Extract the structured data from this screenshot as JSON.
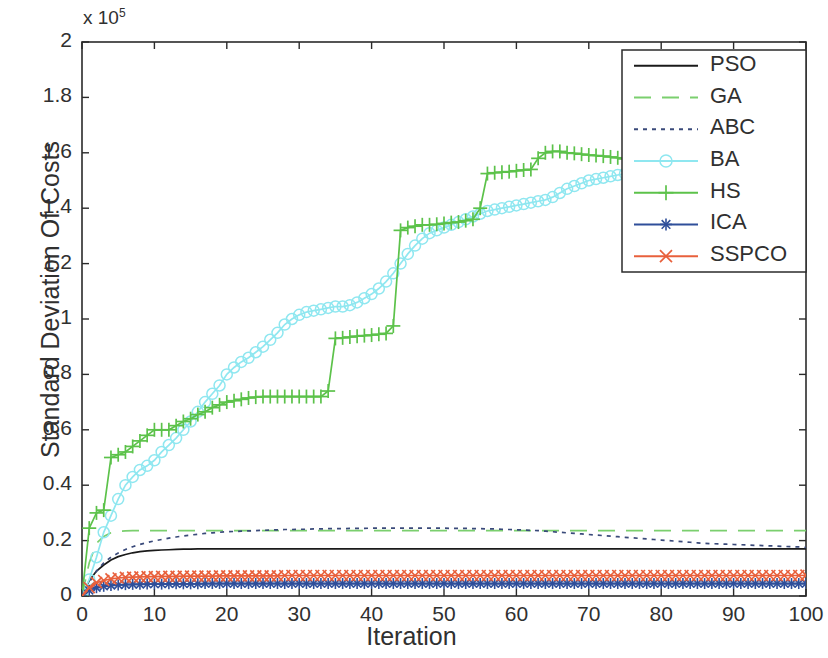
{
  "chart_data": {
    "type": "line",
    "title": "",
    "xlabel": "Iteration",
    "ylabel": "Standard Deviation Of Costs",
    "y_exponent_label": "x 10",
    "y_exponent_power": "5",
    "xlim": [
      0,
      100
    ],
    "ylim": [
      0,
      2
    ],
    "xticks": [
      0,
      10,
      20,
      30,
      40,
      50,
      60,
      70,
      80,
      90,
      100
    ],
    "xticklabels": [
      "0",
      "10",
      "20",
      "30",
      "40",
      "50",
      "60",
      "70",
      "80",
      "90",
      "100"
    ],
    "yticks": [
      0,
      0.2,
      0.4,
      0.6,
      0.8,
      1,
      1.2,
      1.4,
      1.6,
      1.8,
      2
    ],
    "yticklabels": [
      "0",
      "0.2",
      "0.4",
      "0.6",
      "0.8",
      "1",
      "1.2",
      "1.4",
      "1.6",
      "1.8",
      "2"
    ],
    "grid": false,
    "legend_position": "upper right",
    "x": [
      0,
      1,
      2,
      3,
      4,
      5,
      6,
      7,
      8,
      9,
      10,
      11,
      12,
      13,
      14,
      15,
      16,
      17,
      18,
      19,
      20,
      21,
      22,
      23,
      24,
      25,
      26,
      27,
      28,
      29,
      30,
      31,
      32,
      33,
      34,
      35,
      36,
      37,
      38,
      39,
      40,
      41,
      42,
      43,
      44,
      45,
      46,
      47,
      48,
      49,
      50,
      51,
      52,
      53,
      54,
      55,
      56,
      57,
      58,
      59,
      60,
      61,
      62,
      63,
      64,
      65,
      66,
      67,
      68,
      69,
      70,
      71,
      72,
      73,
      74,
      75,
      76,
      77,
      78,
      79,
      80,
      81,
      82,
      83,
      84,
      85,
      86,
      87,
      88,
      89,
      90,
      91,
      92,
      93,
      94,
      95,
      96,
      97,
      98,
      99,
      100
    ],
    "series": [
      {
        "name": "PSO",
        "color": "#1a1a1a",
        "style": "solid",
        "marker": "none",
        "values": [
          0,
          0.055,
          0.09,
          0.112,
          0.13,
          0.142,
          0.15,
          0.156,
          0.16,
          0.163,
          0.165,
          0.166,
          0.167,
          0.168,
          0.169,
          0.169,
          0.17,
          0.17,
          0.17,
          0.17,
          0.17,
          0.17,
          0.17,
          0.17,
          0.17,
          0.17,
          0.17,
          0.17,
          0.17,
          0.17,
          0.17,
          0.17,
          0.17,
          0.17,
          0.17,
          0.17,
          0.17,
          0.17,
          0.17,
          0.17,
          0.17,
          0.17,
          0.17,
          0.17,
          0.17,
          0.17,
          0.17,
          0.17,
          0.17,
          0.17,
          0.17,
          0.17,
          0.17,
          0.17,
          0.17,
          0.17,
          0.17,
          0.17,
          0.17,
          0.17,
          0.17,
          0.17,
          0.17,
          0.17,
          0.17,
          0.17,
          0.17,
          0.17,
          0.17,
          0.17,
          0.17,
          0.17,
          0.17,
          0.17,
          0.17,
          0.17,
          0.17,
          0.17,
          0.17,
          0.17,
          0.17,
          0.17,
          0.17,
          0.17,
          0.17,
          0.17,
          0.17,
          0.17,
          0.17,
          0.17,
          0.17,
          0.17,
          0.17,
          0.17,
          0.17,
          0.17,
          0.17,
          0.17,
          0.17,
          0.17,
          0.17
        ]
      },
      {
        "name": "GA",
        "color": "#7bcf6e",
        "style": "dashed",
        "marker": "none",
        "values": [
          0,
          0.12,
          0.19,
          0.215,
          0.228,
          0.233,
          0.235,
          0.236,
          0.236,
          0.236,
          0.236,
          0.236,
          0.236,
          0.236,
          0.236,
          0.236,
          0.236,
          0.236,
          0.236,
          0.236,
          0.236,
          0.236,
          0.236,
          0.236,
          0.236,
          0.236,
          0.236,
          0.236,
          0.236,
          0.236,
          0.236,
          0.236,
          0.236,
          0.236,
          0.236,
          0.236,
          0.236,
          0.236,
          0.236,
          0.236,
          0.236,
          0.236,
          0.236,
          0.236,
          0.236,
          0.236,
          0.236,
          0.236,
          0.236,
          0.236,
          0.236,
          0.236,
          0.236,
          0.236,
          0.236,
          0.236,
          0.236,
          0.236,
          0.236,
          0.236,
          0.236,
          0.236,
          0.236,
          0.236,
          0.236,
          0.236,
          0.236,
          0.236,
          0.236,
          0.236,
          0.236,
          0.236,
          0.236,
          0.236,
          0.236,
          0.236,
          0.236,
          0.236,
          0.236,
          0.236,
          0.236,
          0.236,
          0.236,
          0.236,
          0.236,
          0.236,
          0.236,
          0.236,
          0.236,
          0.236,
          0.236,
          0.236,
          0.236,
          0.236,
          0.236,
          0.236,
          0.236,
          0.236,
          0.236,
          0.236,
          0.236
        ]
      },
      {
        "name": "ABC",
        "color": "#3a4a7a",
        "style": "dotted",
        "marker": "none",
        "values": [
          0,
          0.05,
          0.09,
          0.12,
          0.14,
          0.155,
          0.168,
          0.178,
          0.186,
          0.193,
          0.199,
          0.204,
          0.209,
          0.213,
          0.217,
          0.22,
          0.223,
          0.226,
          0.228,
          0.23,
          0.232,
          0.233,
          0.234,
          0.235,
          0.236,
          0.237,
          0.238,
          0.239,
          0.24,
          0.24,
          0.241,
          0.241,
          0.242,
          0.242,
          0.243,
          0.243,
          0.243,
          0.244,
          0.244,
          0.244,
          0.245,
          0.245,
          0.245,
          0.245,
          0.245,
          0.245,
          0.245,
          0.245,
          0.245,
          0.245,
          0.245,
          0.244,
          0.244,
          0.244,
          0.243,
          0.243,
          0.242,
          0.242,
          0.241,
          0.24,
          0.239,
          0.238,
          0.237,
          0.236,
          0.234,
          0.232,
          0.23,
          0.228,
          0.226,
          0.224,
          0.222,
          0.22,
          0.218,
          0.216,
          0.214,
          0.212,
          0.21,
          0.208,
          0.206,
          0.204,
          0.202,
          0.2,
          0.198,
          0.196,
          0.194,
          0.192,
          0.19,
          0.189,
          0.188,
          0.187,
          0.186,
          0.185,
          0.184,
          0.183,
          0.182,
          0.181,
          0.18,
          0.179,
          0.178,
          0.177,
          0.175
        ]
      },
      {
        "name": "BA",
        "color": "#8fe7f0",
        "style": "solid",
        "marker": "o",
        "values": [
          0,
          0.06,
          0.14,
          0.23,
          0.29,
          0.35,
          0.4,
          0.43,
          0.455,
          0.47,
          0.49,
          0.52,
          0.545,
          0.57,
          0.6,
          0.63,
          0.665,
          0.7,
          0.73,
          0.76,
          0.8,
          0.825,
          0.845,
          0.86,
          0.88,
          0.9,
          0.925,
          0.95,
          0.98,
          1.0,
          1.015,
          1.025,
          1.03,
          1.035,
          1.04,
          1.045,
          1.045,
          1.05,
          1.06,
          1.075,
          1.09,
          1.11,
          1.135,
          1.165,
          1.2,
          1.235,
          1.265,
          1.29,
          1.31,
          1.32,
          1.33,
          1.34,
          1.35,
          1.36,
          1.37,
          1.38,
          1.39,
          1.395,
          1.4,
          1.405,
          1.41,
          1.415,
          1.42,
          1.425,
          1.43,
          1.44,
          1.455,
          1.47,
          1.48,
          1.49,
          1.5,
          1.505,
          1.51,
          1.515,
          1.52,
          1.525,
          1.535,
          1.545,
          1.555,
          1.56,
          1.565,
          1.57,
          1.575,
          1.578,
          1.58,
          1.582,
          1.585,
          1.588,
          1.59,
          1.592,
          1.594,
          1.595,
          1.596,
          1.597,
          1.598,
          1.598,
          1.599,
          1.599,
          1.6,
          1.6,
          1.6
        ]
      },
      {
        "name": "HS",
        "color": "#5cc24a",
        "style": "solid",
        "marker": "+",
        "values": [
          0,
          0.245,
          0.3,
          0.31,
          0.5,
          0.51,
          0.52,
          0.54,
          0.56,
          0.58,
          0.6,
          0.6,
          0.6,
          0.615,
          0.63,
          0.64,
          0.655,
          0.665,
          0.68,
          0.69,
          0.7,
          0.705,
          0.71,
          0.715,
          0.718,
          0.72,
          0.72,
          0.72,
          0.72,
          0.72,
          0.72,
          0.72,
          0.72,
          0.72,
          0.74,
          0.93,
          0.932,
          0.935,
          0.938,
          0.94,
          0.942,
          0.945,
          0.948,
          0.975,
          1.32,
          1.33,
          1.335,
          1.34,
          1.34,
          1.342,
          1.345,
          1.348,
          1.35,
          1.355,
          1.36,
          1.4,
          1.525,
          1.528,
          1.53,
          1.532,
          1.535,
          1.538,
          1.54,
          1.58,
          1.6,
          1.605,
          1.605,
          1.6,
          1.598,
          1.595,
          1.592,
          1.59,
          1.588,
          1.585,
          1.582,
          1.578,
          1.575,
          1.572,
          1.57,
          1.572,
          1.58,
          1.6,
          1.625,
          1.65,
          1.67,
          1.69,
          1.71,
          1.73,
          1.75,
          1.77,
          1.79,
          1.805,
          1.82,
          1.835,
          1.848,
          1.858,
          1.866,
          1.872,
          1.877,
          1.88,
          1.882
        ]
      },
      {
        "name": "ICA",
        "color": "#2f4f9a",
        "style": "solid",
        "marker": "*",
        "values": [
          0,
          0.02,
          0.03,
          0.035,
          0.038,
          0.04,
          0.041,
          0.042,
          0.042,
          0.043,
          0.043,
          0.043,
          0.044,
          0.044,
          0.044,
          0.044,
          0.044,
          0.045,
          0.045,
          0.045,
          0.045,
          0.045,
          0.045,
          0.045,
          0.045,
          0.045,
          0.045,
          0.045,
          0.045,
          0.045,
          0.045,
          0.045,
          0.045,
          0.045,
          0.045,
          0.045,
          0.045,
          0.045,
          0.045,
          0.045,
          0.045,
          0.045,
          0.045,
          0.045,
          0.045,
          0.045,
          0.045,
          0.045,
          0.045,
          0.045,
          0.045,
          0.045,
          0.045,
          0.045,
          0.045,
          0.045,
          0.045,
          0.045,
          0.045,
          0.045,
          0.045,
          0.045,
          0.045,
          0.045,
          0.045,
          0.045,
          0.045,
          0.045,
          0.045,
          0.045,
          0.045,
          0.045,
          0.045,
          0.045,
          0.045,
          0.045,
          0.045,
          0.045,
          0.045,
          0.045,
          0.045,
          0.045,
          0.045,
          0.045,
          0.045,
          0.045,
          0.045,
          0.045,
          0.045,
          0.045,
          0.045,
          0.045,
          0.045,
          0.045,
          0.045,
          0.045,
          0.045,
          0.045,
          0.045,
          0.045,
          0.045
        ]
      },
      {
        "name": "SSPCO",
        "color": "#e8603c",
        "style": "solid",
        "marker": "x",
        "values": [
          0,
          0.03,
          0.048,
          0.056,
          0.062,
          0.065,
          0.067,
          0.068,
          0.069,
          0.07,
          0.07,
          0.071,
          0.071,
          0.071,
          0.072,
          0.072,
          0.072,
          0.072,
          0.072,
          0.073,
          0.073,
          0.073,
          0.073,
          0.073,
          0.073,
          0.073,
          0.073,
          0.073,
          0.074,
          0.074,
          0.074,
          0.074,
          0.074,
          0.074,
          0.074,
          0.074,
          0.074,
          0.074,
          0.074,
          0.074,
          0.074,
          0.074,
          0.074,
          0.074,
          0.074,
          0.074,
          0.074,
          0.074,
          0.074,
          0.074,
          0.074,
          0.074,
          0.074,
          0.074,
          0.074,
          0.074,
          0.074,
          0.074,
          0.074,
          0.074,
          0.074,
          0.074,
          0.074,
          0.074,
          0.074,
          0.074,
          0.074,
          0.074,
          0.074,
          0.074,
          0.074,
          0.074,
          0.074,
          0.074,
          0.074,
          0.074,
          0.074,
          0.074,
          0.074,
          0.074,
          0.074,
          0.074,
          0.074,
          0.074,
          0.074,
          0.074,
          0.074,
          0.074,
          0.074,
          0.074,
          0.074,
          0.074,
          0.074,
          0.074,
          0.074,
          0.074,
          0.074,
          0.074,
          0.074,
          0.074,
          0.075
        ]
      }
    ],
    "legend": [
      {
        "label": "PSO",
        "color": "#1a1a1a",
        "style": "solid",
        "marker": "none"
      },
      {
        "label": "GA",
        "color": "#7bcf6e",
        "style": "dashed",
        "marker": "none"
      },
      {
        "label": "ABC",
        "color": "#3a4a7a",
        "style": "dotted",
        "marker": "none"
      },
      {
        "label": "BA",
        "color": "#8fe7f0",
        "style": "solid",
        "marker": "o"
      },
      {
        "label": "HS",
        "color": "#5cc24a",
        "style": "solid",
        "marker": "+"
      },
      {
        "label": "ICA",
        "color": "#2f4f9a",
        "style": "solid",
        "marker": "*"
      },
      {
        "label": "SSPCO",
        "color": "#e8603c",
        "style": "solid",
        "marker": "x"
      }
    ]
  }
}
